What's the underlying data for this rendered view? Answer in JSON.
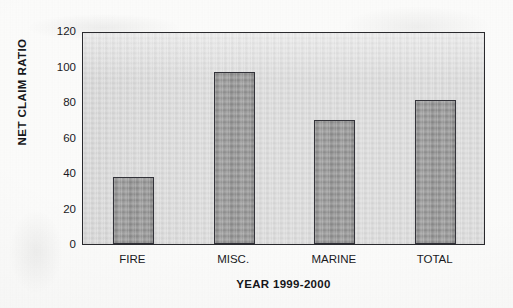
{
  "chart_data": {
    "type": "bar",
    "title": "",
    "subtitle": "",
    "xlabel": "YEAR 1999-2000",
    "ylabel": "NET CLAIM RATIO",
    "categories": [
      "FIRE",
      "MISC.",
      "MARINE",
      "TOTAL"
    ],
    "values": [
      38,
      97,
      70,
      81
    ],
    "ylim": [
      0,
      120
    ],
    "yticks": [
      0,
      20,
      40,
      60,
      80,
      100,
      120
    ],
    "ytick_labels": [
      "0",
      "20",
      "40",
      "60",
      "80",
      "100",
      "120"
    ],
    "grid": false,
    "legend": null,
    "legend_position": "none",
    "annotations": [],
    "series": [
      {
        "name": "Net Claim Ratio",
        "values": [
          38,
          97,
          70,
          81
        ]
      }
    ],
    "colors": {
      "bar_fill": "#a4a4a4",
      "bar_edge": "#33333a",
      "plot_background": "#dedede",
      "page_background": "#fdfdfc",
      "axis_line": "#2a2a2e",
      "text": "#1a1a1e"
    }
  }
}
